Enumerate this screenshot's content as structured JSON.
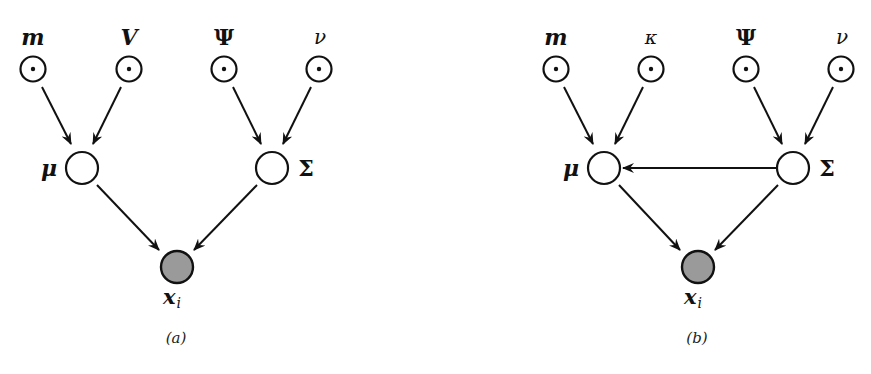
{
  "diagrams": [
    {
      "id": "a",
      "caption": "(a)",
      "nodes": {
        "m": {
          "label": "m",
          "type": "hyperparameter"
        },
        "V": {
          "label": "V",
          "type": "hyperparameter"
        },
        "Psi": {
          "label": "Ψ",
          "type": "hyperparameter"
        },
        "nu": {
          "label": "ν",
          "type": "hyperparameter"
        },
        "mu": {
          "label": "μ",
          "type": "latent"
        },
        "Sigma": {
          "label": "Σ",
          "type": "latent"
        },
        "x": {
          "label": "x",
          "subscript": "i",
          "type": "observed"
        }
      },
      "edges": [
        [
          "m",
          "mu"
        ],
        [
          "V",
          "mu"
        ],
        [
          "Psi",
          "Sigma"
        ],
        [
          "nu",
          "Sigma"
        ],
        [
          "mu",
          "x"
        ],
        [
          "Sigma",
          "x"
        ]
      ]
    },
    {
      "id": "b",
      "caption": "(b)",
      "nodes": {
        "m": {
          "label": "m",
          "type": "hyperparameter"
        },
        "kappa": {
          "label": "κ",
          "type": "hyperparameter"
        },
        "Psi": {
          "label": "Ψ",
          "type": "hyperparameter"
        },
        "nu": {
          "label": "ν",
          "type": "hyperparameter"
        },
        "mu": {
          "label": "μ",
          "type": "latent"
        },
        "Sigma": {
          "label": "Σ",
          "type": "latent"
        },
        "x": {
          "label": "x",
          "subscript": "i",
          "type": "observed"
        }
      },
      "edges": [
        [
          "m",
          "mu"
        ],
        [
          "kappa",
          "mu"
        ],
        [
          "Psi",
          "Sigma"
        ],
        [
          "nu",
          "Sigma"
        ],
        [
          "Sigma",
          "mu"
        ],
        [
          "mu",
          "x"
        ],
        [
          "Sigma",
          "x"
        ]
      ]
    }
  ],
  "colors": {
    "stroke": "#111111",
    "observed_fill": "#9a9a9a",
    "background": "#ffffff"
  }
}
